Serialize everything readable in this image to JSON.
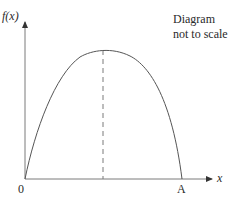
{
  "diagram": {
    "type": "function-curve",
    "y_axis_label": "f(x)",
    "x_axis_label": "x",
    "origin_label": "0",
    "root_label": "A",
    "note_line1": "Diagram",
    "note_line2": "not to scale",
    "colors": {
      "axis": "#7a7a7a",
      "curve": "#555555",
      "dashed": "#7a7a7a",
      "text": "#2a2a2a"
    },
    "geometry": {
      "origin": [
        25,
        179
      ],
      "y_axis_tip": [
        25,
        21
      ],
      "x_axis_tip": [
        212,
        179
      ],
      "peak": [
        103,
        50
      ],
      "root_A": [
        182,
        179
      ]
    }
  }
}
